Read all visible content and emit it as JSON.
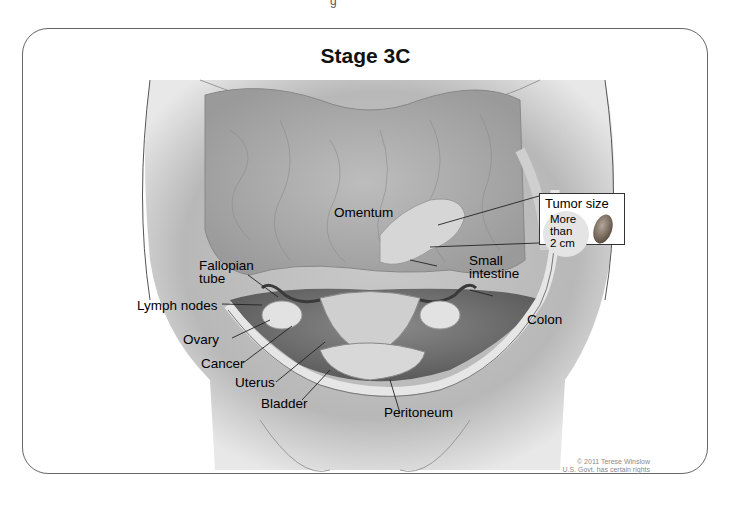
{
  "figure": {
    "title": "Stage 3C",
    "top_cut_text": "g",
    "labels": {
      "omentum": "Omentum",
      "fallopian_tube": "Fallopian\ntube",
      "fallopian_line1": "Fallopian",
      "fallopian_line2": "tube",
      "lymph_nodes": "Lymph nodes",
      "ovary": "Ovary",
      "cancer": "Cancer",
      "uterus": "Uterus",
      "bladder": "Bladder",
      "peritoneum": "Peritoneum",
      "small_intestine_line1": "Small",
      "small_intestine_line2": "intestine",
      "colon": "Colon"
    },
    "inset": {
      "title": "Tumor size",
      "line1": "More",
      "line2": "than",
      "line3": "2 cm"
    },
    "copyright": {
      "line1": "© 2011 Terese Winslow",
      "line2": "U.S. Govt. has certain rights"
    },
    "colors": {
      "frame_border": "#666666",
      "illustration_gray": "#a8a8a8",
      "peritoneum_band": "#e6e6e6"
    }
  }
}
